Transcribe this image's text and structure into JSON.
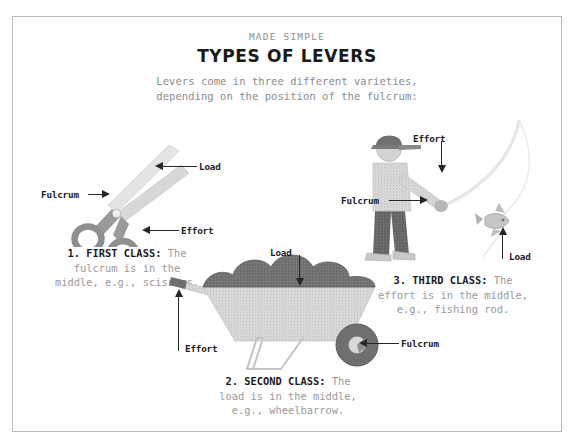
{
  "poster": {
    "kicker": "MADE SIMPLE",
    "title": "TYPES OF LEVERS",
    "intro_line1": "Levers come in three different varieties,",
    "intro_line2": "depending on the position of the fulcrum:",
    "border_color": "#b9b9b9",
    "background_color": "#ffffff"
  },
  "colors": {
    "heading": "#1a1a1a",
    "body_gray": "#8c8c8c",
    "caption_gray": "#9a9a9a",
    "label_dark": "#1c1c1c",
    "arrow": "#262626",
    "scissors_blade": "#e2e2e2",
    "scissors_handle": "#8f8f8f",
    "load_mound": "#6e6e6e",
    "tray_speckle": "#c9c9c9",
    "wheel": "#6b6b6b",
    "figure_pants": "#5e5e5e",
    "rod": "#e8e8e8"
  },
  "levers": [
    {
      "id": "first-class",
      "number": "1.",
      "class_name": "FIRST CLASS",
      "colon": ":",
      "caption_line1": " The",
      "caption_line2": "fulcrum is in the",
      "caption_line3": "middle, e.g., scissors.",
      "tool": "scissors",
      "labels": [
        {
          "name": "load",
          "text": "Load"
        },
        {
          "name": "fulcrum",
          "text": "Fulcrum"
        },
        {
          "name": "effort",
          "text": "Effort"
        }
      ]
    },
    {
      "id": "second-class",
      "number": "2.",
      "class_name": "SECOND CLASS",
      "colon": ":",
      "caption_line1": " The",
      "caption_line2": "load is in the middle,",
      "caption_line3": "e.g., wheelbarrow.",
      "tool": "wheelbarrow",
      "labels": [
        {
          "name": "load",
          "text": "Load"
        },
        {
          "name": "effort",
          "text": "Effort"
        },
        {
          "name": "fulcrum",
          "text": "Fulcrum"
        }
      ]
    },
    {
      "id": "third-class",
      "number": "3.",
      "class_name": "THIRD CLASS",
      "colon": ":",
      "caption_line1": " The",
      "caption_line2": "effort is in the middle,",
      "caption_line3": "e.g., fishing rod.",
      "tool": "fishing-rod",
      "labels": [
        {
          "name": "effort",
          "text": "Effort"
        },
        {
          "name": "fulcrum",
          "text": "Fulcrum"
        },
        {
          "name": "load",
          "text": "Load"
        }
      ]
    }
  ]
}
